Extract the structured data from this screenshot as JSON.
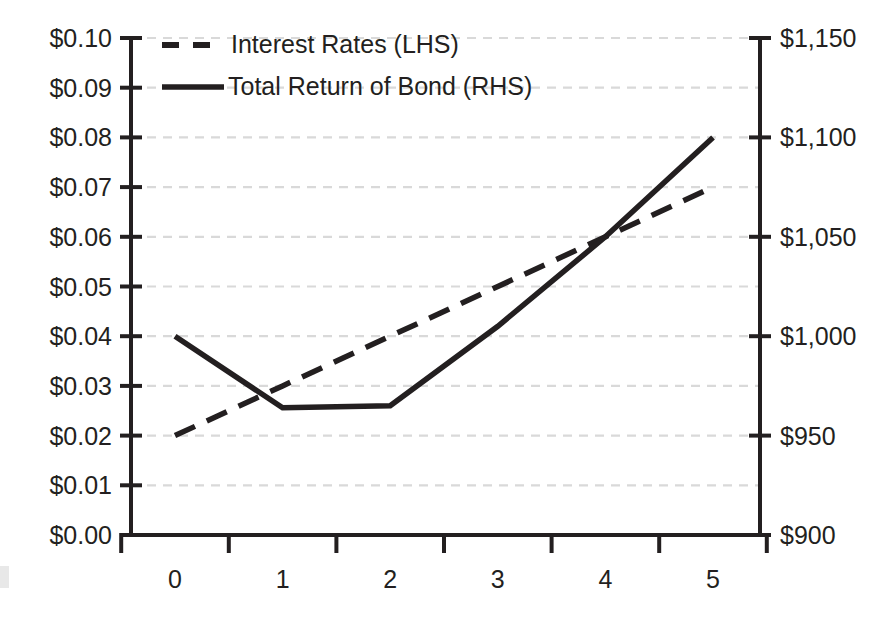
{
  "chart_data": {
    "type": "line",
    "title": "",
    "xlabel": "",
    "ylabel": "",
    "grid": true,
    "legend_position": "top-left inside plot",
    "categories": [
      "0",
      "1",
      "2",
      "3",
      "4",
      "5"
    ],
    "x": [
      0,
      1,
      2,
      3,
      4,
      5
    ],
    "axes": {
      "left": {
        "name": "Interest Rates (LHS)",
        "ylim": [
          0.0,
          0.1
        ],
        "tick_step": 0.01,
        "tick_labels": [
          "$0.10",
          "$0.09",
          "$0.08",
          "$0.07",
          "$0.06",
          "$0.05",
          "$0.04",
          "$0.03",
          "$0.02",
          "$0.01",
          "$0.00"
        ],
        "tick_values": [
          0.1,
          0.09,
          0.08,
          0.07,
          0.06,
          0.05,
          0.04,
          0.03,
          0.02,
          0.01,
          0.0
        ]
      },
      "right": {
        "name": "Total Return of Bond (RHS)",
        "ylim": [
          900,
          1150
        ],
        "tick_step": 50,
        "tick_labels": [
          "$1,150",
          "$1,100",
          "$1,050",
          "$1,000",
          "$950",
          "$900"
        ],
        "tick_values": [
          1150,
          1100,
          1050,
          1000,
          950,
          900
        ]
      },
      "x": {
        "tick_labels": [
          "0",
          "1",
          "2",
          "3",
          "4",
          "5"
        ]
      }
    },
    "series": [
      {
        "name": "Interest Rates (LHS)",
        "axis": "left",
        "style": "dashed",
        "color": "#231f20",
        "values": [
          0.02,
          0.03,
          0.04,
          0.05,
          0.06,
          0.07
        ]
      },
      {
        "name": "Total Return of Bond (RHS)",
        "axis": "right",
        "style": "solid",
        "color": "#231f20",
        "values": [
          1000,
          964,
          965,
          1005,
          1050,
          1100
        ]
      }
    ],
    "legend": [
      {
        "label": "Interest Rates (LHS)",
        "style": "dashed"
      },
      {
        "label": "Total Return of Bond (RHS)",
        "style": "solid"
      }
    ],
    "colors": {
      "series": "#231f20",
      "gridline": "#d9d9d9",
      "axis": "#231f20",
      "background": "#ffffff"
    }
  },
  "geometry": {
    "plot_left": 175,
    "plot_right": 713,
    "plot_top": 38,
    "plot_bottom": 535,
    "left_axis_x": 131,
    "right_axis_x": 760
  }
}
